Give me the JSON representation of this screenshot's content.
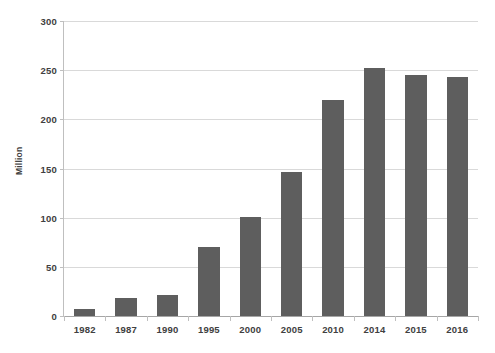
{
  "chart_data": {
    "type": "bar",
    "title": "",
    "xlabel": "",
    "ylabel": "Million",
    "categories": [
      "1982",
      "1987",
      "1990",
      "1995",
      "2000",
      "2005",
      "2010",
      "2014",
      "2015",
      "2016"
    ],
    "values": [
      7,
      18,
      21,
      70,
      101,
      146,
      220,
      252,
      245,
      243
    ],
    "ylim": [
      0,
      300
    ],
    "yticks": [
      0,
      50,
      100,
      150,
      200,
      250,
      300
    ],
    "ytick_labels": [
      "0",
      "50",
      "100",
      "150",
      "200",
      "250",
      "300"
    ],
    "grid": true,
    "legend": false,
    "bar_color": "#5e5e5e",
    "gridline_color": "#d9d9d9",
    "axis_color": "#bfbfbf",
    "text_color": "#404040",
    "background": "#ffffff"
  }
}
